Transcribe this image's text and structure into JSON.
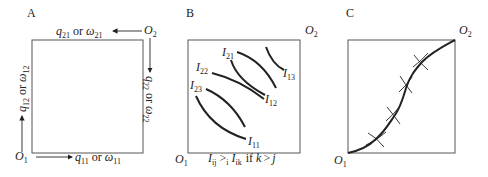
{
  "panels": [
    {
      "id": "A",
      "label": "A",
      "origin_bottom_left": {
        "base": "O",
        "sub": "1"
      },
      "origin_top_right": {
        "base": "O",
        "sub": "2"
      },
      "axes": {
        "bottom": {
          "q": "q",
          "q_sub": "11",
          "or": "or",
          "w": "ω",
          "w_sub": "11"
        },
        "left": {
          "q": "q",
          "q_sub": "12",
          "or": "or",
          "w": "ω",
          "w_sub": "12"
        },
        "top": {
          "q": "q",
          "q_sub": "21",
          "or": "or",
          "w": "ω",
          "w_sub": "21"
        },
        "right": {
          "q": "q",
          "q_sub": "22",
          "or": "or",
          "w": "ω",
          "w_sub": "22"
        }
      }
    },
    {
      "id": "B",
      "label": "B",
      "origin_bottom_left": {
        "base": "O",
        "sub": "1"
      },
      "origin_top_right": {
        "base": "O",
        "sub": "2"
      },
      "curves_consumer1": [
        {
          "base": "I",
          "sub": "11"
        },
        {
          "base": "I",
          "sub": "12"
        },
        {
          "base": "I",
          "sub": "13"
        }
      ],
      "curves_consumer2": [
        {
          "base": "I",
          "sub": "21"
        },
        {
          "base": "I",
          "sub": "22"
        },
        {
          "base": "I",
          "sub": "23"
        }
      ],
      "caption": {
        "lhs": "I",
        "lhs_sub": "ij",
        "rel": ">",
        "rel_sub": "i",
        "rhs": "I",
        "rhs_sub": "ik",
        "cond": "if",
        "k": "k",
        "gt": ">",
        "j": "j"
      }
    },
    {
      "id": "C",
      "label": "C",
      "origin_bottom_left": {
        "base": "O",
        "sub": "1"
      },
      "origin_top_right": {
        "base": "O",
        "sub": "2"
      },
      "contract_curve_tangency_points": 4
    }
  ],
  "colors": {
    "ink": "#222222",
    "frame": "#555555",
    "background": "#ffffff"
  }
}
